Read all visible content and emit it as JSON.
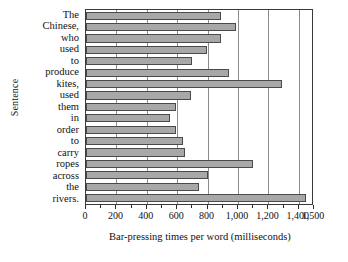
{
  "chart_data": {
    "type": "bar",
    "orientation": "horizontal",
    "title": "",
    "xlabel": "Bar-pressing times per word (milliseconds)",
    "ylabel": "Sentence",
    "categories": [
      "The",
      "Chinese,",
      "who",
      "used",
      "to",
      "produce",
      "kites,",
      "used",
      "them",
      "in",
      "order",
      "to",
      "carry",
      "ropes",
      "across",
      "the",
      "rivers."
    ],
    "values": [
      890,
      985,
      885,
      795,
      700,
      940,
      1290,
      690,
      595,
      555,
      595,
      635,
      650,
      1100,
      800,
      745,
      1450
    ],
    "xlim": [
      0,
      1500
    ],
    "xticks": [
      0,
      200,
      400,
      600,
      800,
      1000,
      1200,
      1400,
      1500
    ],
    "xticklabels": [
      "0",
      "200",
      "400",
      "600",
      "800",
      "1,000",
      "1,200",
      "1,400",
      "1,500"
    ],
    "gridlines": [
      200,
      400,
      600,
      800,
      1000,
      1200,
      1400
    ],
    "grid": true,
    "legend": false,
    "bar_fill": "#a8a8a8",
    "bar_edge": "#4a4a4a",
    "axis_color": "#3a3a3a"
  }
}
